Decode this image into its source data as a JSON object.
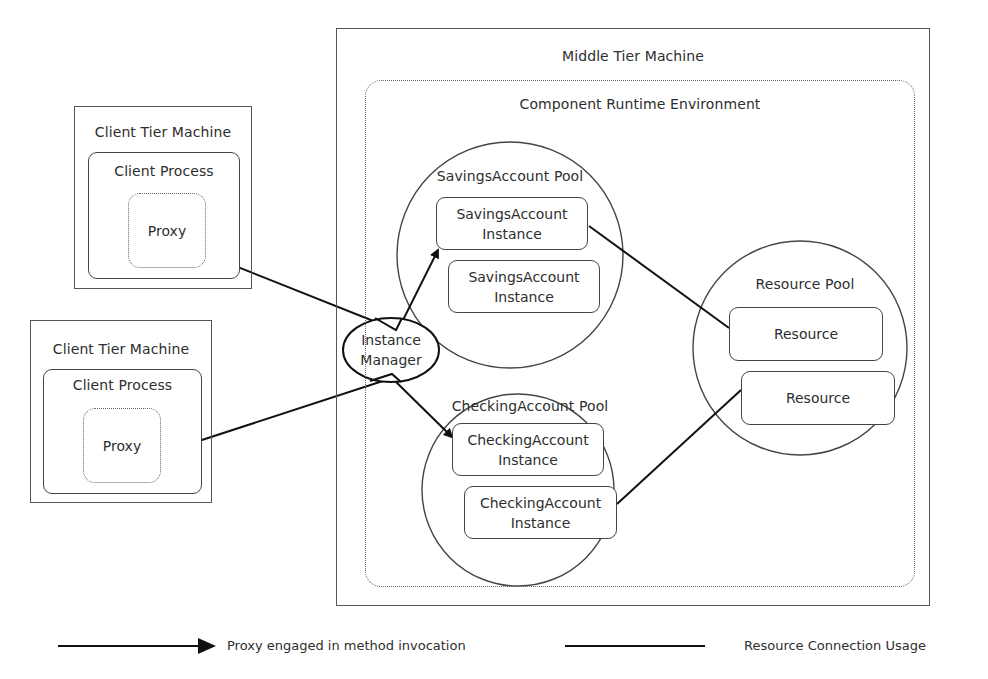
{
  "diagram": {
    "middle_tier": {
      "title": "Middle Tier Machine",
      "runtime": {
        "title": "Component Runtime Environment",
        "instance_manager": {
          "line1": "Instance",
          "line2": "Manager"
        },
        "savings_pool": {
          "title": "SavingsAccount Pool",
          "instances": [
            {
              "line1": "SavingsAccount",
              "line2": "Instance"
            },
            {
              "line1": "SavingsAccount",
              "line2": "Instance"
            }
          ]
        },
        "checking_pool": {
          "title": "CheckingAccount Pool",
          "instances": [
            {
              "line1": "CheckingAccount",
              "line2": "Instance"
            },
            {
              "line1": "CheckingAccount",
              "line2": "Instance"
            }
          ]
        },
        "resource_pool": {
          "title": "Resource Pool",
          "resources": [
            "Resource",
            "Resource"
          ]
        }
      }
    },
    "clients": [
      {
        "machine": "Client Tier Machine",
        "process": "Client Process",
        "proxy": "Proxy"
      },
      {
        "machine": "Client Tier Machine",
        "process": "Client Process",
        "proxy": "Proxy"
      }
    ],
    "legend": {
      "arrow": "Proxy engaged in method invocation",
      "line": "Resource Connection Usage"
    },
    "colors": {
      "stroke": "#1a1a1a",
      "frame": "#555555",
      "text": "#2e2e2e"
    }
  }
}
